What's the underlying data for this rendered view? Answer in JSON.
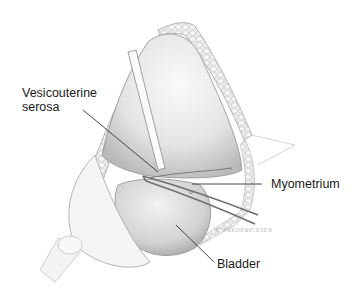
{
  "figure": {
    "type": "surgical illustration",
    "colors": {
      "background": "#ffffff",
      "label_text": "#1a1a1a",
      "leader_line": "#333333",
      "tissue_shade": "#c8c8c8",
      "fat_lobule": "#d6d6d6"
    },
    "labels": [
      {
        "id": "vesicouterine-serosa",
        "line1": "Vesicouterine",
        "line2": "serosa"
      },
      {
        "id": "myometrium",
        "text": "Myometrium"
      },
      {
        "id": "bladder",
        "text": "Bladder"
      }
    ],
    "signature": "E. FREDERICKSEN"
  }
}
